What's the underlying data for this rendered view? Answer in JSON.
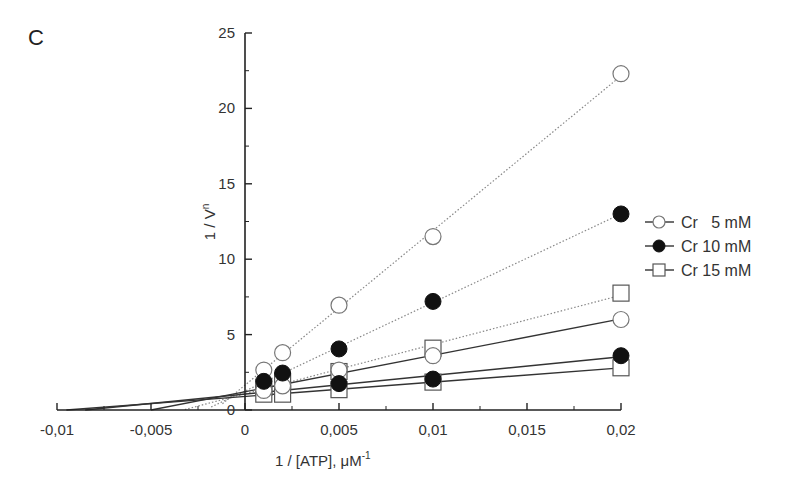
{
  "chart_data": {
    "type": "scatter",
    "panel_label": "C",
    "title": "",
    "xlabel": "1 / [ATP], μM",
    "xlabel_superscript": "-1",
    "ylabel": "1 / V",
    "ylabel_superscript": "n",
    "xlim": [
      -0.01,
      0.02
    ],
    "ylim": [
      0,
      25
    ],
    "x_ticks": [
      -0.01,
      -0.005,
      0,
      0.005,
      0.01,
      0.015,
      0.02
    ],
    "x_tick_labels": [
      "-0,01",
      "-0,005",
      "0",
      "0,005",
      "0,01",
      "0,015",
      "0,02"
    ],
    "y_ticks": [
      0,
      5,
      10,
      15,
      20,
      25
    ],
    "y_tick_labels": [
      "0",
      "5",
      "10",
      "15",
      "20",
      "25"
    ],
    "grid": false,
    "legend_position": "right",
    "legend": [
      {
        "label": "Cr   5 mM",
        "marker": "open-circle"
      },
      {
        "label": "Cr 10 mM",
        "marker": "filled-circle"
      },
      {
        "label": "Cr 15 mM",
        "marker": "open-square"
      }
    ],
    "series": [
      {
        "name": "Cr 5 mM (dotted)",
        "marker": "open-circle",
        "line": "dotted",
        "x": [
          0.001,
          0.002,
          0.005,
          0.01,
          0.02
        ],
        "y": [
          2.65,
          3.8,
          6.95,
          11.5,
          22.3
        ],
        "fit_x": [
          -0.0012,
          0.02
        ]
      },
      {
        "name": "Cr 10 mM (dotted)",
        "marker": "filled-circle",
        "line": "dotted",
        "x": [
          0.001,
          0.002,
          0.005,
          0.01,
          0.02
        ],
        "y": [
          1.9,
          2.45,
          4.05,
          7.2,
          13.0
        ],
        "fit_x": [
          -0.0018,
          0.02
        ]
      },
      {
        "name": "Cr 15 mM (dotted)",
        "marker": "open-square",
        "line": "dotted",
        "x": [
          0.001,
          0.002,
          0.005,
          0.01,
          0.02
        ],
        "y": [
          1.5,
          1.9,
          2.55,
          4.1,
          7.75
        ],
        "fit_x": [
          -0.0032,
          0.02
        ]
      },
      {
        "name": "Cr 5 mM (solid)",
        "marker": "open-circle",
        "line": "solid",
        "x": [
          0.001,
          0.002,
          0.005,
          0.01,
          0.02
        ],
        "y": [
          1.3,
          1.6,
          2.65,
          3.6,
          6.0
        ],
        "fit_x": [
          -0.005,
          0.02
        ]
      },
      {
        "name": "Cr 10 mM (solid)",
        "marker": "filled-circle",
        "line": "solid",
        "x": [
          0.005,
          0.01,
          0.02
        ],
        "y": [
          1.75,
          2.05,
          3.6
        ],
        "fit_x": [
          -0.0085,
          0.02
        ]
      },
      {
        "name": "Cr 15 mM (solid)",
        "marker": "open-square",
        "line": "solid",
        "x": [
          0.001,
          0.002,
          0.005,
          0.01,
          0.02
        ],
        "y": [
          1.05,
          1.05,
          1.35,
          1.85,
          2.8
        ],
        "fit_x": [
          -0.0095,
          0.02
        ]
      }
    ]
  }
}
